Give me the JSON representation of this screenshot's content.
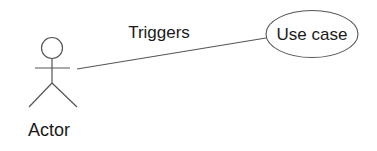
{
  "diagram": {
    "type": "uml-use-case",
    "actor": {
      "label": "Actor"
    },
    "association": {
      "label": "Triggers"
    },
    "use_case": {
      "label": "Use case"
    }
  },
  "colors": {
    "stroke": "#555555",
    "text": "#1a1a1a",
    "background": "#ffffff"
  }
}
